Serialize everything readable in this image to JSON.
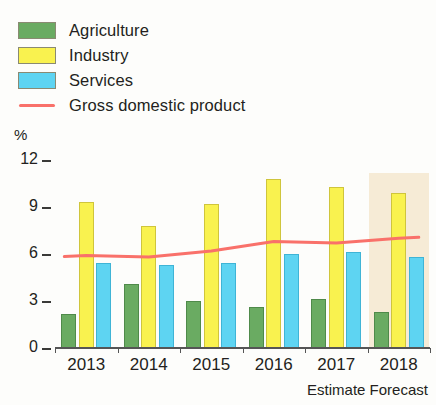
{
  "chart_data": {
    "type": "bar",
    "title": "",
    "subtitle": "",
    "xlabel": "",
    "ylabel": "%",
    "categories": [
      "2013",
      "2014",
      "2015",
      "2016",
      "2017",
      "2018"
    ],
    "series": [
      {
        "name": "Agriculture",
        "color": "#6aab62",
        "values": [
          2.2,
          4.1,
          3.0,
          2.6,
          3.1,
          2.3
        ]
      },
      {
        "name": "Industry",
        "color": "#f9f24f",
        "values": [
          9.3,
          7.8,
          9.2,
          10.8,
          10.3,
          9.9
        ]
      },
      {
        "name": "Services",
        "color": "#5ed4f2",
        "values": [
          5.4,
          5.3,
          5.4,
          6.0,
          6.1,
          5.8
        ]
      }
    ],
    "line_series": [
      {
        "name": "Gross domestic product",
        "color": "#f9716a",
        "values": [
          5.9,
          5.8,
          6.2,
          6.8,
          6.7,
          7.0
        ]
      }
    ],
    "ylim": [
      0,
      12
    ],
    "yticks": [
      0,
      3,
      6,
      9,
      12
    ],
    "ytick_labels": [
      "0",
      "3",
      "6",
      "9",
      "12"
    ],
    "grid": false,
    "legend_position": "top-left",
    "annotations": [
      {
        "text": "Estimate",
        "under_category": "2017"
      },
      {
        "text": "Forecast",
        "under_category": "2018"
      }
    ],
    "shaded_region": {
      "label": "Forecast",
      "from_category": "2018",
      "color": "#f3e4ca"
    }
  },
  "legend": {
    "items": [
      {
        "label": "Agriculture",
        "icon": "square-swatch",
        "color": "#6aab62"
      },
      {
        "label": "Industry",
        "icon": "square-swatch",
        "color": "#f9f24f"
      },
      {
        "label": "Services",
        "icon": "square-swatch",
        "color": "#5ed4f2"
      },
      {
        "label": "Gross domestic product",
        "icon": "line-swatch",
        "color": "#f9716a"
      }
    ]
  },
  "axes": {
    "y_unit": "%",
    "y_tick_labels": [
      "12",
      "9",
      "6",
      "3",
      "0"
    ],
    "x_tick_labels": [
      "2013",
      "2014",
      "2015",
      "2016",
      "2017",
      "2018"
    ],
    "x_sub_labels": [
      "Estimate",
      "Forecast"
    ]
  }
}
